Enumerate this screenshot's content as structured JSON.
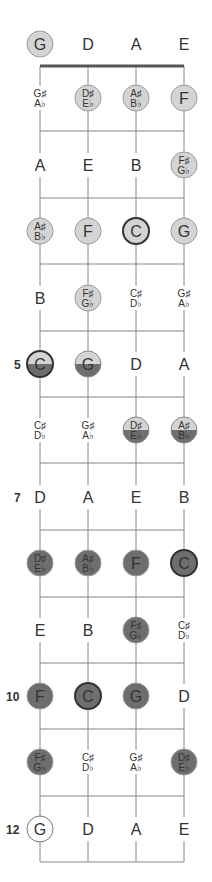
{
  "title": "",
  "strings": [
    "G",
    "D",
    "A",
    "E"
  ],
  "colors": {
    "background": "#ffffff",
    "line": "#888888",
    "nut": "#555555",
    "text": "#333333",
    "light_fill": "#d4d4d4",
    "dark_fill": "#6e6e6e",
    "root_border": "#333333",
    "outline_border": "#777777"
  },
  "fret_markers": [
    {
      "fret": 5,
      "label": "5"
    },
    {
      "fret": 7,
      "label": "7"
    },
    {
      "fret": 10,
      "label": "10"
    },
    {
      "fret": 12,
      "label": "12"
    }
  ],
  "rows": [
    {
      "fret": 0,
      "notes": [
        {
          "name": [
            "G"
          ],
          "style": "light"
        },
        {
          "name": [
            "D"
          ],
          "style": "none"
        },
        {
          "name": [
            "A"
          ],
          "style": "none"
        },
        {
          "name": [
            "E"
          ],
          "style": "none"
        }
      ]
    },
    {
      "fret": 1,
      "notes": [
        {
          "name": [
            "G♯",
            "A♭"
          ],
          "style": "none"
        },
        {
          "name": [
            "D♯",
            "E♭"
          ],
          "style": "light"
        },
        {
          "name": [
            "A♯",
            "B♭"
          ],
          "style": "light"
        },
        {
          "name": [
            "F"
          ],
          "style": "light"
        }
      ]
    },
    {
      "fret": 2,
      "notes": [
        {
          "name": [
            "A"
          ],
          "style": "none"
        },
        {
          "name": [
            "E"
          ],
          "style": "none"
        },
        {
          "name": [
            "B"
          ],
          "style": "none"
        },
        {
          "name": [
            "F♯",
            "G♭"
          ],
          "style": "light"
        }
      ]
    },
    {
      "fret": 3,
      "notes": [
        {
          "name": [
            "A♯",
            "B♭"
          ],
          "style": "light"
        },
        {
          "name": [
            "F"
          ],
          "style": "light"
        },
        {
          "name": [
            "C"
          ],
          "style": "light",
          "root": true
        },
        {
          "name": [
            "G"
          ],
          "style": "light"
        }
      ]
    },
    {
      "fret": 4,
      "notes": [
        {
          "name": [
            "B"
          ],
          "style": "none"
        },
        {
          "name": [
            "F♯",
            "G♭"
          ],
          "style": "light"
        },
        {
          "name": [
            "C♯",
            "D♭"
          ],
          "style": "none"
        },
        {
          "name": [
            "G♯",
            "A♭"
          ],
          "style": "none"
        }
      ]
    },
    {
      "fret": 5,
      "notes": [
        {
          "name": [
            "C"
          ],
          "style": "half",
          "root": true
        },
        {
          "name": [
            "G"
          ],
          "style": "half"
        },
        {
          "name": [
            "D"
          ],
          "style": "none"
        },
        {
          "name": [
            "A"
          ],
          "style": "none"
        }
      ]
    },
    {
      "fret": 6,
      "notes": [
        {
          "name": [
            "C♯",
            "D♭"
          ],
          "style": "none"
        },
        {
          "name": [
            "G♯",
            "A♭"
          ],
          "style": "none"
        },
        {
          "name": [
            "D♯",
            "E♭"
          ],
          "style": "half"
        },
        {
          "name": [
            "A♯",
            "B♭"
          ],
          "style": "half"
        }
      ]
    },
    {
      "fret": 7,
      "notes": [
        {
          "name": [
            "D"
          ],
          "style": "none"
        },
        {
          "name": [
            "A"
          ],
          "style": "none"
        },
        {
          "name": [
            "E"
          ],
          "style": "none"
        },
        {
          "name": [
            "B"
          ],
          "style": "none"
        }
      ]
    },
    {
      "fret": 8,
      "notes": [
        {
          "name": [
            "D♯",
            "E♭"
          ],
          "style": "dark"
        },
        {
          "name": [
            "A♯",
            "B♭"
          ],
          "style": "dark"
        },
        {
          "name": [
            "F"
          ],
          "style": "dark"
        },
        {
          "name": [
            "C"
          ],
          "style": "dark",
          "root": true
        }
      ]
    },
    {
      "fret": 9,
      "notes": [
        {
          "name": [
            "E"
          ],
          "style": "none"
        },
        {
          "name": [
            "B"
          ],
          "style": "none"
        },
        {
          "name": [
            "F♯",
            "G♭"
          ],
          "style": "dark"
        },
        {
          "name": [
            "C♯",
            "D♭"
          ],
          "style": "none"
        }
      ]
    },
    {
      "fret": 10,
      "notes": [
        {
          "name": [
            "F"
          ],
          "style": "dark"
        },
        {
          "name": [
            "C"
          ],
          "style": "dark",
          "root": true
        },
        {
          "name": [
            "G"
          ],
          "style": "dark"
        },
        {
          "name": [
            "D"
          ],
          "style": "none"
        }
      ]
    },
    {
      "fret": 11,
      "notes": [
        {
          "name": [
            "F♯",
            "G♭"
          ],
          "style": "dark"
        },
        {
          "name": [
            "C♯",
            "D♭"
          ],
          "style": "none"
        },
        {
          "name": [
            "G♯",
            "A♭"
          ],
          "style": "none"
        },
        {
          "name": [
            "D♯",
            "E♭"
          ],
          "style": "dark"
        }
      ]
    },
    {
      "fret": 12,
      "notes": [
        {
          "name": [
            "G"
          ],
          "style": "outline"
        },
        {
          "name": [
            "D"
          ],
          "style": "none"
        },
        {
          "name": [
            "A"
          ],
          "style": "none"
        },
        {
          "name": [
            "E"
          ],
          "style": "none"
        }
      ]
    }
  ]
}
